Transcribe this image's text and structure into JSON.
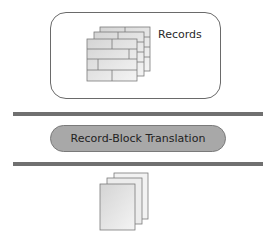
{
  "records_box": {
    "label": "Records"
  },
  "process": {
    "label": "Record-Block Translation"
  },
  "output": {
    "icon": "blocks-stack-icon"
  },
  "colors": {
    "bar": "#707070",
    "pill_fill": "#a8a8a8",
    "box_border": "#6a6a6a",
    "page_fill": "#e6e6e6"
  }
}
